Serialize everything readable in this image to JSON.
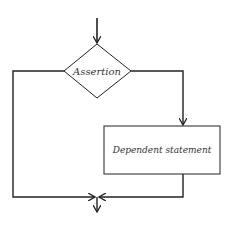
{
  "diagram": {
    "decision": {
      "label": "Assertion"
    },
    "process": {
      "label": "Dependent statement"
    },
    "colors": {
      "line": "#222222",
      "background": "#ffffff"
    }
  }
}
